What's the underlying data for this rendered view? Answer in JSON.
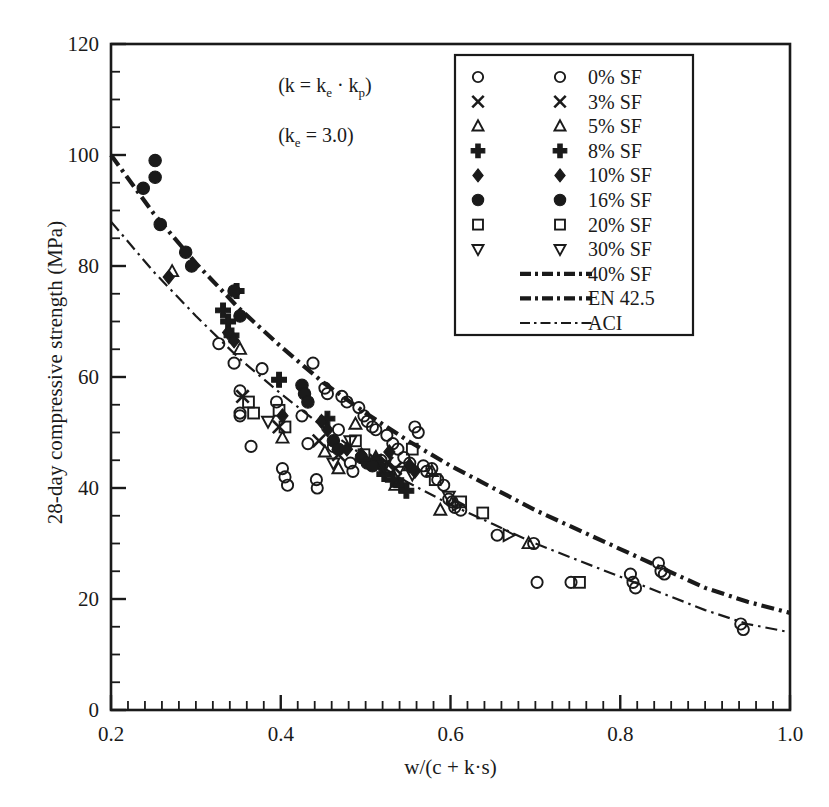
{
  "chart_data": {
    "type": "scatter",
    "title": "",
    "xlabel": "w/(c + k·s)",
    "ylabel": "28-day compressive strength (MPa)",
    "xlim": [
      0.2,
      1.0
    ],
    "ylim": [
      0,
      120
    ],
    "xticks": [
      0.2,
      0.4,
      0.6,
      0.8,
      1.0
    ],
    "xtick_labels": [
      "0.2",
      "0.4",
      "0.6",
      "0.8",
      "1.0"
    ],
    "yticks": [
      0,
      20,
      40,
      60,
      80,
      100,
      120
    ],
    "ytick_labels": [
      "0",
      "20",
      "40",
      "60",
      "80",
      "100",
      "120"
    ],
    "x_minor_step": 0.02,
    "y_minor_step": 5,
    "grid": false,
    "legend_position": "top-right",
    "annotations": [
      {
        "text": "(k = kₑ · kₚ)",
        "x": 0.45,
        "y": 112
      },
      {
        "text": "(kₑ = 3.0)",
        "x": 0.45,
        "y": 103
      }
    ],
    "series": [
      {
        "name": "0% SF",
        "marker": "circle-open",
        "points": [
          [
            0.327,
            66.0
          ],
          [
            0.345,
            62.5
          ],
          [
            0.352,
            57.5
          ],
          [
            0.352,
            53.5
          ],
          [
            0.352,
            53.0
          ],
          [
            0.365,
            47.5
          ],
          [
            0.378,
            61.5
          ],
          [
            0.395,
            55.5
          ],
          [
            0.402,
            43.5
          ],
          [
            0.405,
            42.0
          ],
          [
            0.408,
            40.5
          ],
          [
            0.425,
            53.0
          ],
          [
            0.432,
            48.0
          ],
          [
            0.438,
            62.5
          ],
          [
            0.442,
            41.5
          ],
          [
            0.443,
            40.0
          ],
          [
            0.452,
            58.0
          ],
          [
            0.455,
            57.0
          ],
          [
            0.462,
            47.5
          ],
          [
            0.468,
            50.5
          ],
          [
            0.472,
            56.5
          ],
          [
            0.478,
            55.5
          ],
          [
            0.482,
            44.5
          ],
          [
            0.485,
            43.0
          ],
          [
            0.492,
            54.5
          ],
          [
            0.498,
            53.0
          ],
          [
            0.502,
            52.0
          ],
          [
            0.508,
            51.0
          ],
          [
            0.512,
            50.5
          ],
          [
            0.518,
            45.0
          ],
          [
            0.525,
            49.5
          ],
          [
            0.532,
            48.0
          ],
          [
            0.538,
            47.0
          ],
          [
            0.545,
            45.5
          ],
          [
            0.552,
            44.5
          ],
          [
            0.558,
            51.0
          ],
          [
            0.562,
            50.0
          ],
          [
            0.568,
            44.0
          ],
          [
            0.572,
            43.0
          ],
          [
            0.578,
            43.5
          ],
          [
            0.585,
            41.5
          ],
          [
            0.592,
            40.5
          ],
          [
            0.598,
            38.0
          ],
          [
            0.602,
            37.5
          ],
          [
            0.605,
            36.5
          ],
          [
            0.612,
            36.0
          ],
          [
            0.655,
            31.5
          ],
          [
            0.698,
            30.0
          ],
          [
            0.702,
            23.0
          ],
          [
            0.742,
            23.0
          ],
          [
            0.812,
            24.5
          ],
          [
            0.815,
            23.0
          ],
          [
            0.818,
            22.0
          ],
          [
            0.845,
            26.5
          ],
          [
            0.848,
            25.0
          ],
          [
            0.852,
            24.5
          ],
          [
            0.942,
            15.5
          ],
          [
            0.945,
            14.5
          ]
        ]
      },
      {
        "name": "3% SF",
        "marker": "cross-x",
        "points": [
          [
            0.398,
            51.0
          ],
          [
            0.445,
            48.5
          ],
          [
            0.468,
            46.0
          ],
          [
            0.512,
            45.0
          ],
          [
            0.525,
            44.5
          ],
          [
            0.535,
            43.5
          ],
          [
            0.355,
            56.5
          ]
        ]
      },
      {
        "name": "5% SF",
        "marker": "triangle-up-open",
        "points": [
          [
            0.272,
            79.0
          ],
          [
            0.352,
            65.0
          ],
          [
            0.402,
            49.0
          ],
          [
            0.452,
            46.5
          ],
          [
            0.468,
            43.5
          ],
          [
            0.488,
            51.5
          ],
          [
            0.512,
            45.5
          ],
          [
            0.535,
            40.5
          ],
          [
            0.552,
            44.0
          ],
          [
            0.578,
            43.0
          ],
          [
            0.588,
            36.0
          ],
          [
            0.692,
            30.0
          ]
        ]
      },
      {
        "name": "8% SF",
        "marker": "plus-filled",
        "points": [
          [
            0.332,
            72.0
          ],
          [
            0.338,
            70.0
          ],
          [
            0.342,
            67.5
          ],
          [
            0.348,
            75.5
          ],
          [
            0.398,
            59.5
          ],
          [
            0.455,
            52.5
          ],
          [
            0.522,
            42.5
          ],
          [
            0.532,
            41.5
          ],
          [
            0.542,
            40.5
          ],
          [
            0.548,
            39.5
          ]
        ]
      },
      {
        "name": "10% SF",
        "marker": "diamond-filled",
        "points": [
          [
            0.268,
            78.0
          ],
          [
            0.338,
            68.0
          ],
          [
            0.345,
            66.5
          ],
          [
            0.402,
            53.0
          ],
          [
            0.448,
            52.0
          ],
          [
            0.455,
            50.5
          ],
          [
            0.478,
            47.0
          ],
          [
            0.495,
            46.0
          ],
          [
            0.512,
            45.0
          ],
          [
            0.518,
            44.0
          ],
          [
            0.528,
            46.5
          ],
          [
            0.552,
            44.0
          ],
          [
            0.558,
            43.0
          ]
        ]
      },
      {
        "name": "16% SF",
        "marker": "circle-filled",
        "points": [
          [
            0.238,
            94.0
          ],
          [
            0.252,
            99.0
          ],
          [
            0.252,
            96.0
          ],
          [
            0.258,
            87.5
          ],
          [
            0.288,
            82.5
          ],
          [
            0.295,
            80.0
          ],
          [
            0.345,
            75.5
          ],
          [
            0.352,
            71.0
          ],
          [
            0.425,
            58.5
          ],
          [
            0.428,
            57.0
          ],
          [
            0.432,
            55.5
          ],
          [
            0.462,
            48.5
          ],
          [
            0.468,
            47.0
          ],
          [
            0.495,
            45.5
          ],
          [
            0.502,
            44.5
          ],
          [
            0.508,
            44.0
          ]
        ]
      },
      {
        "name": "20% SF",
        "marker": "square-open",
        "points": [
          [
            0.362,
            55.5
          ],
          [
            0.368,
            53.5
          ],
          [
            0.398,
            54.0
          ],
          [
            0.405,
            51.0
          ],
          [
            0.488,
            48.5
          ],
          [
            0.498,
            46.0
          ],
          [
            0.555,
            47.0
          ],
          [
            0.582,
            41.5
          ],
          [
            0.612,
            37.5
          ],
          [
            0.638,
            35.5
          ],
          [
            0.752,
            23.0
          ]
        ]
      },
      {
        "name": "30% SF",
        "marker": "triangle-down-open",
        "points": [
          [
            0.385,
            52.0
          ],
          [
            0.462,
            44.5
          ],
          [
            0.482,
            48.5
          ],
          [
            0.522,
            44.0
          ],
          [
            0.538,
            43.0
          ],
          [
            0.555,
            42.5
          ],
          [
            0.598,
            38.5
          ]
        ]
      },
      {
        "name": "40% SF",
        "marker": "triangle-right-open",
        "points": [
          [
            0.608,
            37.0
          ],
          [
            0.668,
            31.5
          ]
        ]
      }
    ],
    "curves": [
      {
        "name": "EN 42.5",
        "style": "dash-dot-thick",
        "points": [
          [
            0.2,
            100.0
          ],
          [
            0.25,
            89.5
          ],
          [
            0.3,
            80.5
          ],
          [
            0.35,
            72.5
          ],
          [
            0.4,
            65.5
          ],
          [
            0.45,
            59.0
          ],
          [
            0.5,
            53.5
          ],
          [
            0.55,
            48.5
          ],
          [
            0.6,
            44.0
          ],
          [
            0.65,
            40.0
          ],
          [
            0.7,
            36.0
          ],
          [
            0.75,
            32.5
          ],
          [
            0.8,
            29.0
          ],
          [
            0.85,
            25.5
          ],
          [
            0.9,
            22.0
          ],
          [
            0.95,
            19.5
          ],
          [
            1.0,
            17.5
          ]
        ]
      },
      {
        "name": "ACI",
        "style": "dash-dot-thin",
        "points": [
          [
            0.2,
            88.0
          ],
          [
            0.25,
            79.0
          ],
          [
            0.3,
            71.0
          ],
          [
            0.35,
            63.5
          ],
          [
            0.4,
            57.0
          ],
          [
            0.45,
            51.0
          ],
          [
            0.5,
            45.5
          ],
          [
            0.55,
            41.0
          ],
          [
            0.6,
            37.0
          ],
          [
            0.65,
            33.5
          ],
          [
            0.7,
            30.0
          ],
          [
            0.75,
            27.0
          ],
          [
            0.8,
            24.0
          ],
          [
            0.85,
            21.0
          ],
          [
            0.9,
            18.0
          ],
          [
            0.95,
            15.5
          ],
          [
            1.0,
            14.0
          ]
        ]
      }
    ]
  },
  "legend": {
    "entries": [
      {
        "label": "0% SF",
        "marker": "circle-open"
      },
      {
        "label": "3% SF",
        "marker": "cross-x"
      },
      {
        "label": "5% SF",
        "marker": "triangle-up-open"
      },
      {
        "label": "8% SF",
        "marker": "plus-filled"
      },
      {
        "label": "10% SF",
        "marker": "diamond-filled"
      },
      {
        "label": "16% SF",
        "marker": "circle-filled"
      },
      {
        "label": "20% SF",
        "marker": "square-open"
      },
      {
        "label": "30% SF",
        "marker": "triangle-down-open"
      },
      {
        "label": "40% SF",
        "marker": "line-dash-dot-thick"
      },
      {
        "label": "EN 42.5",
        "marker": "line-dash-dot-thick"
      },
      {
        "label": "ACI",
        "marker": "line-dash-dot-thin"
      }
    ]
  },
  "colors": {
    "ink": "#1a1a1a",
    "axis": "#111111",
    "background": "#ffffff"
  }
}
